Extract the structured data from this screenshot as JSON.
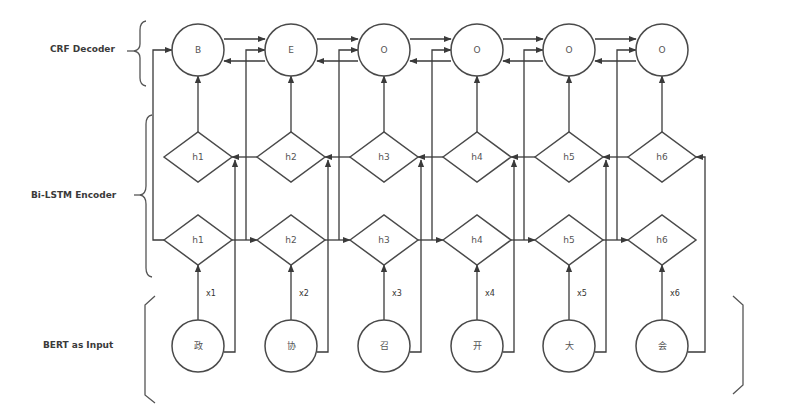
{
  "diagram": {
    "layers": {
      "crf": {
        "label": "CRF Decoder",
        "tags": [
          "B",
          "E",
          "O",
          "O",
          "O",
          "O"
        ]
      },
      "bilstm": {
        "label": "Bi-LSTM Encoder",
        "backward_states": [
          "h1",
          "h2",
          "h3",
          "h4",
          "h5",
          "h6"
        ],
        "forward_states": [
          "h1",
          "h2",
          "h3",
          "h4",
          "h5",
          "h6"
        ]
      },
      "input": {
        "label": "BERT as Input",
        "tokens": [
          "政",
          "协",
          "召",
          "开",
          "大",
          "会"
        ],
        "embeddings": [
          "x1",
          "x2",
          "x3",
          "x4",
          "x5",
          "x6"
        ]
      }
    },
    "colors": {
      "stroke": "#4a4a4a",
      "background": "#ffffff",
      "text": "#3a3a3a"
    }
  }
}
